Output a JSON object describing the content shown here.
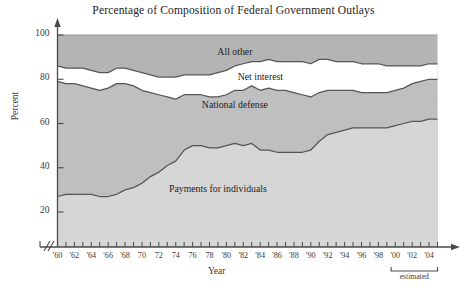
{
  "chart_data": {
    "type": "area",
    "title": "Percentage of Composition of Federal Government Outlays",
    "xlabel": "Year",
    "ylabel": "Percent",
    "ylim": [
      20,
      100
    ],
    "xlim": [
      1960,
      2005
    ],
    "grid": false,
    "legend_position": "inline-band-labels",
    "stacked": true,
    "axis_break": true,
    "yticks": [
      20,
      40,
      60,
      80,
      100
    ],
    "ytick_labels": [
      "20",
      "40",
      "60",
      "80",
      "100"
    ],
    "xticks": [
      1960,
      1961,
      1962,
      1963,
      1964,
      1965,
      1966,
      1967,
      1968,
      1969,
      1970,
      1971,
      1972,
      1973,
      1974,
      1975,
      1976,
      1977,
      1978,
      1979,
      1980,
      1981,
      1982,
      1983,
      1984,
      1985,
      1986,
      1987,
      1988,
      1989,
      1990,
      1991,
      1992,
      1993,
      1994,
      1995,
      1996,
      1997,
      1998,
      1999,
      2000,
      2001,
      2002,
      2003,
      2004,
      2005
    ],
    "xtick_labels": [
      "'60",
      "",
      "'62",
      "",
      "'64",
      "",
      "'66",
      "",
      "'68",
      "",
      "70",
      "",
      "72",
      "",
      "74",
      "",
      "76",
      "",
      "78",
      "",
      "'80",
      "",
      "'82",
      "",
      "'84",
      "",
      "'86",
      "",
      "'88",
      "",
      "'90",
      "",
      "'92",
      "",
      "'94",
      "",
      "'96",
      "",
      "'98",
      "",
      "'00",
      "",
      "'02",
      "",
      "'04",
      ""
    ],
    "annotations": [
      {
        "text": "estimated",
        "from_year": 1999.5,
        "to_year": 2005
      }
    ],
    "x": [
      1960,
      1961,
      1962,
      1963,
      1964,
      1965,
      1966,
      1967,
      1968,
      1969,
      1970,
      1971,
      1972,
      1973,
      1974,
      1975,
      1976,
      1977,
      1978,
      1979,
      1980,
      1981,
      1982,
      1983,
      1984,
      1985,
      1986,
      1987,
      1988,
      1989,
      1990,
      1991,
      1992,
      1993,
      1994,
      1995,
      1996,
      1997,
      1998,
      1999,
      2000,
      2001,
      2002,
      2003,
      2004,
      2005
    ],
    "series": [
      {
        "name": "Payments for individuals",
        "fill": "#d6d6d6",
        "cumulative_top": [
          27,
          28,
          28,
          28,
          28,
          27,
          27,
          28,
          30,
          31,
          33,
          36,
          38,
          41,
          43,
          48,
          50,
          50,
          49,
          49,
          50,
          51,
          50,
          51,
          48,
          48,
          47,
          47,
          47,
          47,
          48,
          52,
          55,
          56,
          57,
          58,
          58,
          58,
          58,
          58,
          59,
          60,
          61,
          61,
          62,
          62
        ]
      },
      {
        "name": "National defense",
        "fill": "#bfbfbf",
        "cumulative_top": [
          79,
          78,
          78,
          77,
          76,
          75,
          76,
          78,
          78,
          77,
          75,
          74,
          73,
          72,
          71,
          73,
          73,
          73,
          72,
          72,
          73,
          75,
          75,
          77,
          75,
          76,
          75,
          75,
          74,
          73,
          72,
          74,
          75,
          75,
          75,
          75,
          74,
          74,
          74,
          74,
          75,
          76,
          78,
          79,
          80,
          80
        ]
      },
      {
        "name": "Net interest",
        "fill": "#ffffff",
        "cumulative_top": [
          86,
          85,
          85,
          85,
          84,
          83,
          83,
          85,
          85,
          84,
          83,
          82,
          81,
          81,
          81,
          82,
          82,
          82,
          82,
          83,
          84,
          86,
          87,
          88,
          88,
          89,
          88,
          88,
          88,
          88,
          87,
          89,
          89,
          88,
          88,
          88,
          87,
          87,
          87,
          86,
          86,
          86,
          86,
          86,
          87,
          87
        ]
      },
      {
        "name": "All other",
        "fill": "#b4b4b4",
        "cumulative_top": [
          100,
          100,
          100,
          100,
          100,
          100,
          100,
          100,
          100,
          100,
          100,
          100,
          100,
          100,
          100,
          100,
          100,
          100,
          100,
          100,
          100,
          100,
          100,
          100,
          100,
          100,
          100,
          100,
          100,
          100,
          100,
          100,
          100,
          100,
          100,
          100,
          100,
          100,
          100,
          100,
          100,
          100,
          100,
          100,
          100,
          100
        ]
      }
    ],
    "band_labels": [
      {
        "text": "All other",
        "x_year": 1981,
        "y_percent": 92
      },
      {
        "text": "Net interest",
        "x_year": 1984,
        "y_percent": 80.5
      },
      {
        "text": "National defense",
        "x_year": 1981,
        "y_percent": 68
      },
      {
        "text": "Payments for individuals",
        "x_year": 1979,
        "y_percent": 30
      }
    ]
  },
  "caption_fragment": "",
  "colors": {
    "all_other": "#b4b4b4",
    "net_interest": "#ffffff",
    "national_defense": "#bfbfbf",
    "payments_for_individuals": "#d6d6d6",
    "axis": "#4a4a4a",
    "curve": "#555555",
    "text": "#2b2b2b"
  }
}
